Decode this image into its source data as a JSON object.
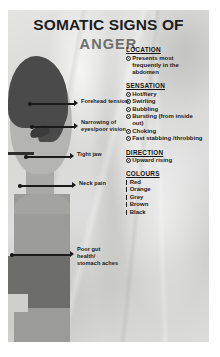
{
  "poster": {
    "title_main": "SOMATIC SIGNS OF",
    "title_sub": "ANGER",
    "title_main_color": "#1e1e1e",
    "title_sub_color": "#6f6f6f",
    "background_color": "#d8d8d6"
  },
  "annotations": [
    {
      "label": "Forehead tension"
    },
    {
      "label": "Narrowing of\neyes/poor vision"
    },
    {
      "label": "Tight jaw"
    },
    {
      "label": "Neck pain"
    },
    {
      "label": "Poor gut\nhealth/\nstomach aches"
    }
  ],
  "sections": [
    {
      "heading": "LOCATION",
      "bullet": "spiral",
      "items": [
        "Presents most\nfrequently in the\nabdomen"
      ]
    },
    {
      "heading": "SENSATION",
      "bullet": "spiral",
      "items": [
        "Hot/fiery",
        "Swirling",
        "Bubbling",
        "Bursting (from\ninside out)",
        "Choking",
        "Fast stabbing\n/throbbing"
      ]
    },
    {
      "heading": "DIRECTION",
      "bullet": "spiral",
      "items": [
        "Upward rising"
      ]
    },
    {
      "heading": "COLOURS",
      "bullet": "tick",
      "items": [
        "Red",
        "Orange",
        "Grey",
        "Brown",
        "Black"
      ]
    }
  ],
  "figure": {
    "hair_color": "#4a4a4a",
    "skin_color": "#b4b4b2",
    "body_color": "#9b9b99",
    "belly_color": "#6d6d6b",
    "shoe_color": "#3d3d3d"
  }
}
